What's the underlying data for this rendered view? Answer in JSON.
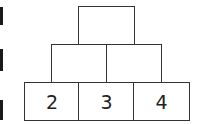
{
  "pyramid": {
    "rows": [
      {
        "cells": [
          {
            "value": ""
          }
        ]
      },
      {
        "cells": [
          {
            "value": ""
          },
          {
            "value": ""
          }
        ]
      },
      {
        "cells": [
          {
            "value": "2"
          },
          {
            "value": "3"
          },
          {
            "value": "4"
          }
        ]
      }
    ]
  },
  "colors": {
    "stroke": "#333333",
    "text": "#222222",
    "edge_marks": "#1a1a1a"
  }
}
